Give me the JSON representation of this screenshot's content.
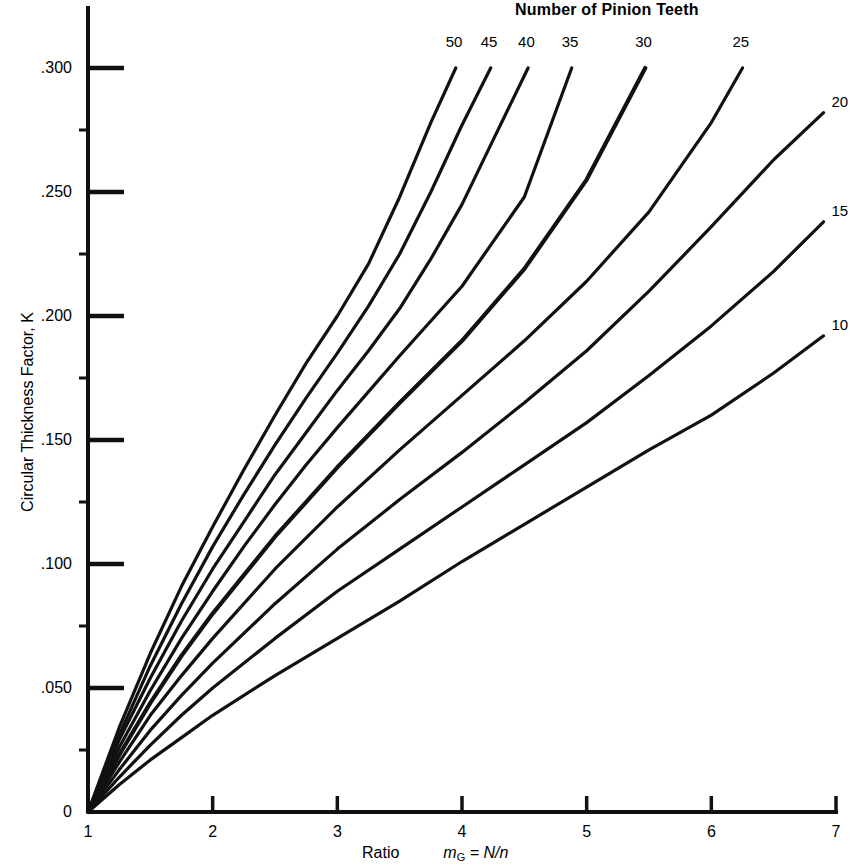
{
  "chart_data": {
    "type": "line",
    "title": "Number of Pinion Teeth",
    "xlabel_prefix": "Ratio",
    "xlabel_symbol": "m",
    "xlabel_subscript": "G",
    "xlabel_rest": " = N/n",
    "ylabel": "Circular Thickness Factor, K",
    "xlim": [
      1,
      7
    ],
    "ylim": [
      0,
      0.315
    ],
    "xticks": [
      "1",
      "2",
      "3",
      "4",
      "5",
      "6",
      "7"
    ],
    "xtick_values": [
      1,
      2,
      3,
      4,
      5,
      6,
      7
    ],
    "yticks": [
      "0",
      ".050",
      ".100",
      ".150",
      ".200",
      ".250",
      ".300"
    ],
    "ytick_values": [
      0,
      0.05,
      0.1,
      0.15,
      0.2,
      0.25,
      0.3
    ],
    "grid": false,
    "legend_position": "curve-end-labels",
    "line_color": "#111111",
    "background": "#ffffff",
    "series": [
      {
        "name": "50",
        "label": "50",
        "label_position": "top",
        "x": [
          1.0,
          1.25,
          1.5,
          1.75,
          2.0,
          2.25,
          2.5,
          2.75,
          3.0,
          3.25,
          3.5,
          3.75,
          3.95
        ],
        "values": [
          0.0,
          0.034,
          0.064,
          0.091,
          0.115,
          0.138,
          0.16,
          0.181,
          0.2,
          0.221,
          0.248,
          0.278,
          0.3
        ]
      },
      {
        "name": "45",
        "label": "45",
        "label_position": "top",
        "x": [
          1.0,
          1.25,
          1.5,
          1.75,
          2.0,
          2.25,
          2.5,
          2.75,
          3.0,
          3.25,
          3.5,
          3.75,
          4.0,
          4.23
        ],
        "values": [
          0.0,
          0.031,
          0.059,
          0.084,
          0.107,
          0.128,
          0.148,
          0.167,
          0.185,
          0.204,
          0.225,
          0.25,
          0.277,
          0.3
        ]
      },
      {
        "name": "40",
        "label": "40",
        "label_position": "top",
        "x": [
          1.0,
          1.25,
          1.5,
          1.75,
          2.0,
          2.25,
          2.5,
          2.75,
          3.0,
          3.25,
          3.5,
          3.75,
          4.0,
          4.25,
          4.53
        ],
        "values": [
          0.0,
          0.029,
          0.054,
          0.077,
          0.098,
          0.117,
          0.136,
          0.153,
          0.17,
          0.186,
          0.203,
          0.223,
          0.245,
          0.271,
          0.3
        ]
      },
      {
        "name": "35",
        "label": "35",
        "label_position": "top",
        "x": [
          1.0,
          1.25,
          1.5,
          1.75,
          2.0,
          2.25,
          2.5,
          2.75,
          3.0,
          3.5,
          4.0,
          4.5,
          4.88
        ],
        "values": [
          0.0,
          0.026,
          0.049,
          0.07,
          0.089,
          0.107,
          0.124,
          0.14,
          0.155,
          0.184,
          0.212,
          0.248,
          0.3
        ]
      },
      {
        "name": "30",
        "label": "30",
        "label_position": "top",
        "x": [
          1.0,
          1.25,
          1.5,
          1.75,
          2.0,
          2.5,
          3.0,
          3.5,
          4.0,
          4.5,
          5.0,
          5.47
        ],
        "values": [
          0.0,
          0.023,
          0.044,
          0.063,
          0.08,
          0.111,
          0.139,
          0.165,
          0.19,
          0.219,
          0.255,
          0.3
        ]
      },
      {
        "name": "25",
        "label": "25",
        "label_position": "top",
        "x": [
          1.0,
          1.25,
          1.5,
          1.75,
          2.0,
          2.5,
          3.0,
          3.5,
          4.0,
          4.5,
          5.0,
          5.5,
          6.0,
          6.25
        ],
        "values": [
          0.0,
          0.02,
          0.039,
          0.055,
          0.07,
          0.098,
          0.123,
          0.146,
          0.168,
          0.19,
          0.214,
          0.242,
          0.278,
          0.3
        ]
      },
      {
        "name": "20",
        "label": "20",
        "label_position": "right",
        "x": [
          1.0,
          1.25,
          1.5,
          1.75,
          2.0,
          2.5,
          3.0,
          3.5,
          4.0,
          4.5,
          5.0,
          5.5,
          6.0,
          6.5,
          6.9
        ],
        "values": [
          0.0,
          0.017,
          0.033,
          0.047,
          0.06,
          0.084,
          0.106,
          0.126,
          0.145,
          0.165,
          0.186,
          0.21,
          0.236,
          0.263,
          0.282
        ]
      },
      {
        "name": "15",
        "label": "15",
        "label_position": "right",
        "x": [
          1.0,
          1.25,
          1.5,
          1.75,
          2.0,
          2.5,
          3.0,
          3.5,
          4.0,
          4.5,
          5.0,
          5.5,
          6.0,
          6.5,
          6.9
        ],
        "values": [
          0.0,
          0.014,
          0.027,
          0.039,
          0.05,
          0.07,
          0.089,
          0.106,
          0.123,
          0.14,
          0.157,
          0.176,
          0.196,
          0.218,
          0.238
        ]
      },
      {
        "name": "10",
        "label": "10",
        "label_position": "right",
        "x": [
          1.0,
          1.25,
          1.5,
          1.75,
          2.0,
          2.5,
          3.0,
          3.5,
          4.0,
          4.5,
          5.0,
          5.5,
          6.0,
          6.5,
          6.9
        ],
        "values": [
          0.0,
          0.011,
          0.021,
          0.03,
          0.039,
          0.055,
          0.07,
          0.085,
          0.101,
          0.116,
          0.131,
          0.146,
          0.16,
          0.177,
          0.192
        ]
      }
    ]
  }
}
